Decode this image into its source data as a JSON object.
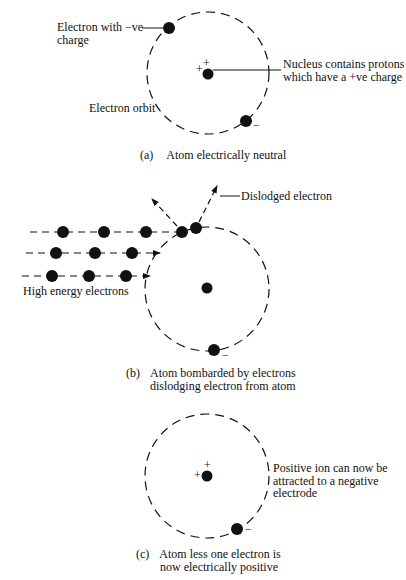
{
  "panels": {
    "a": {
      "label_electron_1": "Electron with −ve",
      "label_electron_2": "charge",
      "label_nucleus_1": "Nucleus contains protons",
      "label_nucleus_2": "which have a +ve charge",
      "label_orbit": "Electron orbit",
      "caption_letter": "(a)",
      "caption_1": "Atom electrically neutral",
      "plus_signs": [
        "+",
        "+"
      ],
      "minus_sign": "−"
    },
    "b": {
      "label_dislodged": "Dislodged electron",
      "label_high_energy": "High energy electrons",
      "caption_letter": "(b)",
      "caption_1": "Atom bombarded by electrons",
      "caption_2": "dislodging electron from atom",
      "minus_sign": "−"
    },
    "c": {
      "label_ion_1": "Positive ion can now be",
      "label_ion_2": "attracted to a negative",
      "label_ion_3": "electrode",
      "caption_letter": "(c)",
      "caption_1": "Atom less one electron is",
      "caption_2": "now electrically positive",
      "plus_signs": [
        "+",
        "+"
      ],
      "minus_sign": "−"
    }
  },
  "colors": {
    "ink": "#111111",
    "background": "#ffffff"
  }
}
